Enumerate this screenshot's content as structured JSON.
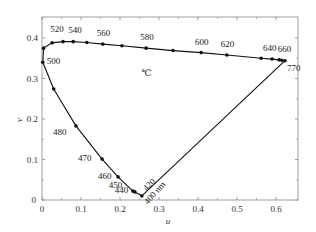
{
  "chart_data": {
    "type": "line",
    "title": "",
    "xlabel": "u",
    "ylabel": "v",
    "xlim": [
      0,
      0.655
    ],
    "ylim": [
      0,
      0.455
    ],
    "grid": false,
    "x_ticks": [
      {
        "value": 0,
        "label": "0"
      },
      {
        "value": 0.1,
        "label": "0.1"
      },
      {
        "value": 0.2,
        "label": "0.2"
      },
      {
        "value": 0.3,
        "label": "0.3"
      },
      {
        "value": 0.4,
        "label": "0.4"
      },
      {
        "value": 0.5,
        "label": "0.5"
      },
      {
        "value": 0.6,
        "label": "0.6"
      }
    ],
    "y_ticks": [
      {
        "value": 0,
        "label": "0"
      },
      {
        "value": 0.1,
        "label": "0.1"
      },
      {
        "value": 0.2,
        "label": "0.2"
      },
      {
        "value": 0.3,
        "label": "0.3"
      },
      {
        "value": 0.4,
        "label": "0.4"
      }
    ],
    "annotation": "℃",
    "annotation_pos": {
      "u": 0.255,
      "v": 0.305
    },
    "series": [
      {
        "name": "spectrum locus",
        "points": [
          {
            "nm": 400,
            "u": 0.256,
            "v": 0.01,
            "label": "400 nm"
          },
          {
            "nm": 420,
            "u": 0.255,
            "v": 0.011,
            "label": "420"
          },
          {
            "nm": 440,
            "u": 0.238,
            "v": 0.02,
            "label": "440"
          },
          {
            "nm": 450,
            "u": 0.233,
            "v": 0.022,
            "label": "450"
          },
          {
            "nm": 460,
            "u": 0.195,
            "v": 0.057,
            "label": "460"
          },
          {
            "nm": 470,
            "u": 0.154,
            "v": 0.101,
            "label": "470"
          },
          {
            "nm": 480,
            "u": 0.087,
            "v": 0.183,
            "label": "480"
          },
          {
            "nm": 490,
            "u": 0.03,
            "v": 0.274,
            "label": ""
          },
          {
            "nm": 500,
            "u": 0.002,
            "v": 340,
            "label": "500"
          },
          {
            "nm": 510,
            "u": 0.004,
            "v": 0.375,
            "label": ""
          },
          {
            "nm": 520,
            "u": 0.026,
            "v": 0.388,
            "label": "520"
          },
          {
            "nm": 530,
            "u": 0.054,
            "v": 0.391,
            "label": ""
          },
          {
            "nm": 540,
            "u": 0.08,
            "v": 0.391,
            "label": "540"
          },
          {
            "nm": 550,
            "u": 0.115,
            "v": 0.389,
            "label": ""
          },
          {
            "nm": 560,
            "u": 0.156,
            "v": 0.385,
            "label": "560"
          },
          {
            "nm": 570,
            "u": 0.205,
            "v": 0.381,
            "label": ""
          },
          {
            "nm": 580,
            "u": 0.267,
            "v": 0.375,
            "label": "580"
          },
          {
            "nm": 590,
            "u": 0.336,
            "v": 0.369,
            "label": ""
          },
          {
            "nm": 600,
            "u": 0.408,
            "v": 0.364,
            "label": "600"
          },
          {
            "nm": 620,
            "u": 0.474,
            "v": 0.358,
            "label": "620"
          },
          {
            "nm": 630,
            "u": 0.562,
            "v": 0.35,
            "label": ""
          },
          {
            "nm": 640,
            "u": 0.59,
            "v": 0.348,
            "label": "640"
          },
          {
            "nm": 650,
            "u": 0.608,
            "v": 0.346,
            "label": ""
          },
          {
            "nm": 660,
            "u": 0.615,
            "v": 0.345,
            "label": "660"
          },
          {
            "nm": 770,
            "u": 0.623,
            "v": 0.344,
            "label": "770"
          }
        ]
      }
    ]
  }
}
